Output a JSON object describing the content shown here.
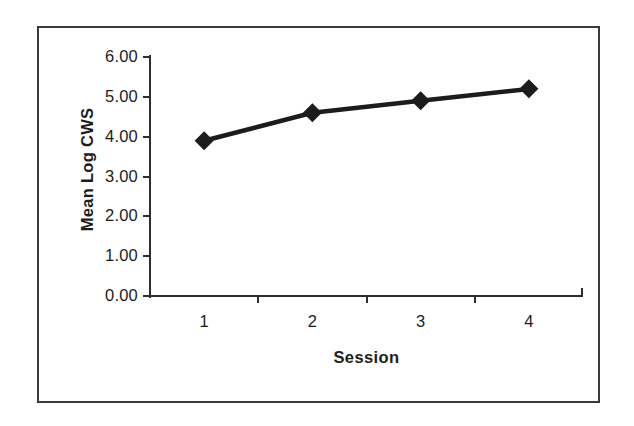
{
  "chart_data": {
    "type": "line",
    "title": "",
    "subtitle": "",
    "xlabel": "Session",
    "ylabel": "Mean Log CWS",
    "categories": [
      "1",
      "2",
      "3",
      "4"
    ],
    "x": [
      1,
      2,
      3,
      4
    ],
    "values": [
      3.9,
      4.6,
      4.9,
      5.2
    ],
    "series": [
      {
        "name": "Mean Log CWS",
        "values": [
          3.9,
          4.6,
          4.9,
          5.2
        ],
        "color": "#1c1c1c",
        "marker": "diamond",
        "line_style": "solid"
      }
    ],
    "ylim": [
      0.0,
      6.0
    ],
    "ytick_labels": [
      "0.00",
      "1.00",
      "2.00",
      "3.00",
      "4.00",
      "5.00",
      "6.00"
    ],
    "ytick_values": [
      0,
      1,
      2,
      3,
      4,
      5,
      6
    ],
    "xtick_labels": [
      "1",
      "2",
      "3",
      "4"
    ],
    "grid": false,
    "legend": false,
    "legend_position": "none",
    "annotations": []
  },
  "figure": {
    "border_color": "#3a3a3a",
    "background_color": "#ffffff",
    "axis_color": "#2e2e2e",
    "text_color": "#1d1d1d"
  }
}
